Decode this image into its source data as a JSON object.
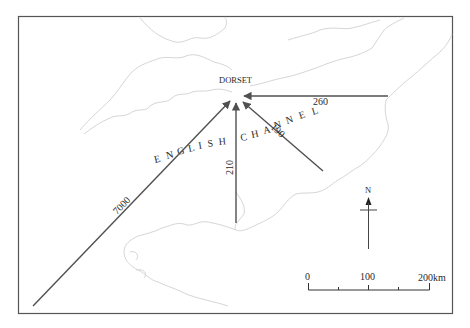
{
  "map": {
    "place_label": "DORSET",
    "sea_label_letters": [
      "E",
      "N",
      "G",
      "L",
      "I",
      "S",
      "H",
      " ",
      "C",
      "H",
      "A",
      "N",
      "N",
      "E",
      "L"
    ],
    "sea_label": "ENGLISH CHANNEL",
    "colors": {
      "frame": "#555555",
      "arrow": "#505050",
      "coastline": "#d8d8d8",
      "text": "#2a2a2a"
    },
    "flows": [
      {
        "label": "7000",
        "from": "southwest",
        "angle_desc": "long diagonal from bottom-left"
      },
      {
        "label": "210",
        "from": "south",
        "angle_desc": "vertical from below"
      },
      {
        "label": "190",
        "from": "southeast",
        "angle_desc": "diagonal from lower-right"
      },
      {
        "label": "260",
        "from": "east",
        "angle_desc": "horizontal from right"
      }
    ],
    "north_arrow": {
      "label": "N"
    },
    "scale_bar": {
      "ticks": [
        "0",
        "100",
        "200km"
      ]
    }
  }
}
